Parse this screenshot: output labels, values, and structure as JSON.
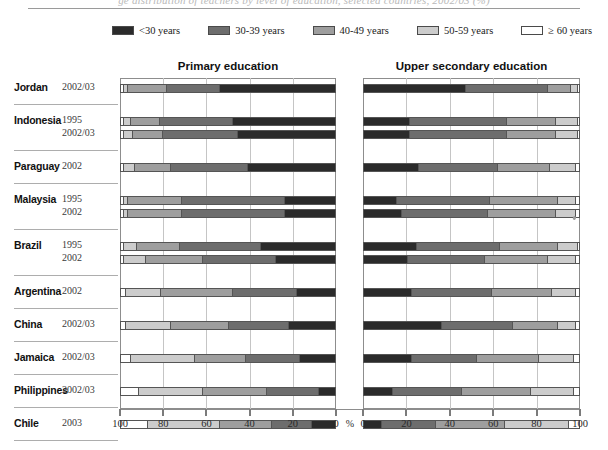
{
  "figure": {
    "cut_title": "ge distribution of teachers by level of education, selected countries, 2002/03 (%)",
    "percent_symbol": "%"
  },
  "legend": {
    "items": [
      {
        "label": "<30 years",
        "color": "#2b2b2b"
      },
      {
        "label": "30-39 years",
        "color": "#6d6d6d"
      },
      {
        "label": "40-49 years",
        "color": "#9e9e9e"
      },
      {
        "label": "50-59 years",
        "color": "#cccccc"
      },
      {
        "label": "≥ 60 years",
        "color": "#ffffff"
      }
    ]
  },
  "panels": [
    {
      "id": "primary",
      "title": "Primary education",
      "direction": "right-to-left",
      "axis_ticks": [
        100,
        80,
        60,
        40,
        20,
        0
      ]
    },
    {
      "id": "secondary",
      "title": "Upper secondary education",
      "direction": "left-to-right",
      "axis_ticks": [
        0,
        20,
        40,
        60,
        80,
        100
      ]
    }
  ],
  "rows": [
    {
      "country": "Jordan",
      "year": "2002/03",
      "group": 0
    },
    {
      "country": "Indonesia",
      "year": "1995",
      "group": 1
    },
    {
      "country": "",
      "year": "2002/03",
      "group": 1
    },
    {
      "country": "Paraguay",
      "year": "2002",
      "group": 2
    },
    {
      "country": "Malaysia",
      "year": "1995",
      "group": 3
    },
    {
      "country": "",
      "year": "2002",
      "group": 3
    },
    {
      "country": "Brazil",
      "year": "1995",
      "group": 4
    },
    {
      "country": "",
      "year": "2002",
      "group": 4
    },
    {
      "country": "Argentina",
      "year": "2002",
      "group": 5
    },
    {
      "country": "China",
      "year": "2002/03",
      "group": 6
    },
    {
      "country": "Jamaica",
      "year": "2002/03",
      "group": 7
    },
    {
      "country": "Philippines",
      "year": "2002/03",
      "group": 8
    },
    {
      "country": "Chile",
      "year": "2003",
      "group": 9
    }
  ],
  "chart_data": {
    "type": "bar",
    "subtype": "stacked-horizontal-diverging",
    "xlabel": "%",
    "ylabel": "",
    "xlim": [
      0,
      100
    ],
    "grid": true,
    "legend_position": "top",
    "series_names": [
      "<30 years",
      "30-39 years",
      "40-49 years",
      "50-59 years",
      "≥ 60 years"
    ],
    "categories": [
      "Jordan 2002/03",
      "Indonesia 1995",
      "Indonesia 2002/03",
      "Paraguay 2002",
      "Malaysia 1995",
      "Malaysia 2002",
      "Brazil 1995",
      "Brazil 2002",
      "Argentina 2002",
      "China 2002/03",
      "Jamaica 2002/03",
      "Philippines 2002/03",
      "Chile 2003"
    ],
    "panels": [
      {
        "name": "Primary education",
        "axis_ticks": [
          100,
          80,
          60,
          40,
          20,
          0
        ],
        "stacks": [
          {
            "category": "Jordan 2002/03",
            "values": {
              "<30 years": 54,
              "30-39 years": 25,
              "40-49 years": 18,
              "50-59 years": 2,
              "≥ 60 years": 1
            }
          },
          {
            "category": "Indonesia 1995",
            "values": {
              "<30 years": 48,
              "30-39 years": 34,
              "40-49 years": 14,
              "50-59 years": 3,
              "≥ 60 years": 1
            }
          },
          {
            "country_note": "",
            "category": "Indonesia 2002/03",
            "values": {
              "<30 years": 46,
              "30-39 years": 35,
              "40-49 years": 14,
              "50-59 years": 4,
              "≥ 60 years": 1
            }
          },
          {
            "category": "Paraguay 2002",
            "values": {
              "<30 years": 41,
              "30-39 years": 36,
              "40-49 years": 17,
              "50-59 years": 5,
              "≥ 60 years": 1
            }
          },
          {
            "category": "Malaysia 1995",
            "values": {
              "<30 years": 24,
              "30-39 years": 48,
              "40-49 years": 25,
              "50-59 years": 2,
              "≥ 60 years": 1
            }
          },
          {
            "category": "Malaysia 2002",
            "values": {
              "<30 years": 24,
              "30-39 years": 48,
              "40-49 years": 25,
              "50-59 years": 2,
              "≥ 60 years": 1
            }
          },
          {
            "category": "Brazil 1995",
            "values": {
              "<30 years": 35,
              "30-39 years": 38,
              "40-49 years": 20,
              "50-59 years": 6,
              "≥ 60 years": 1
            }
          },
          {
            "category": "Brazil 2002",
            "values": {
              "<30 years": 28,
              "30-39 years": 34,
              "40-49 years": 27,
              "50-59 years": 10,
              "≥ 60 years": 1
            }
          },
          {
            "category": "Argentina 2002",
            "values": {
              "<30 years": 18,
              "30-39 years": 30,
              "40-49 years": 34,
              "50-59 years": 16,
              "≥ 60 years": 2
            }
          },
          {
            "category": "China 2002/03",
            "values": {
              "<30 years": 22,
              "30-39 years": 28,
              "40-49 years": 27,
              "50-59 years": 21,
              "≥ 60 years": 2
            }
          },
          {
            "category": "Jamaica 2002/03",
            "values": {
              "<30 years": 17,
              "30-39 years": 25,
              "40-49 years": 24,
              "50-59 years": 30,
              "≥ 60 years": 4
            }
          },
          {
            "category": "Philippines 2002/03",
            "values": {
              "<30 years": 8,
              "30-39 years": 24,
              "40-49 years": 30,
              "50-59 years": 30,
              "≥ 60 years": 8
            }
          },
          {
            "category": "Chile 2003",
            "values": {
              "<30 years": 11,
              "30-39 years": 19,
              "40-49 years": 24,
              "50-59 years": 34,
              "≥ 60 years": 12
            }
          }
        ]
      },
      {
        "name": "Upper secondary education",
        "axis_ticks": [
          0,
          20,
          40,
          60,
          80,
          100
        ],
        "stacks": [
          {
            "category": "Jordan 2002/03",
            "values": {
              "<30 years": 47,
              "30-39 years": 38,
              "40-49 years": 11,
              "50-59 years": 3,
              "≥ 60 years": 1
            }
          },
          {
            "category": "Indonesia 1995",
            "values": {
              "<30 years": 21,
              "30-39 years": 45,
              "40-49 years": 23,
              "50-59 years": 10,
              "≥ 60 years": 1
            }
          },
          {
            "category": "Indonesia 2002/03",
            "values": {
              "<30 years": 21,
              "30-39 years": 45,
              "40-49 years": 23,
              "50-59 years": 10,
              "≥ 60 years": 1
            }
          },
          {
            "category": "Paraguay 2002",
            "values": {
              "<30 years": 25,
              "30-39 years": 37,
              "40-49 years": 24,
              "50-59 years": 12,
              "≥ 60 years": 2
            }
          },
          {
            "category": "Malaysia 1995",
            "values": {
              "<30 years": 15,
              "30-39 years": 43,
              "40-49 years": 32,
              "50-59 years": 8,
              "≥ 60 years": 2
            }
          },
          {
            "category": "Malaysia 2002",
            "values": {
              "<30 years": 17,
              "30-39 years": 40,
              "40-49 years": 32,
              "50-59 years": 9,
              "≥ 60 years": 2
            }
          },
          {
            "category": "Brazil 1995",
            "values": {
              "<30 years": 24,
              "30-39 years": 39,
              "40-49 years": 27,
              "50-59 years": 9,
              "≥ 60 years": 1
            }
          },
          {
            "category": "Brazil 2002",
            "values": {
              "<30 years": 20,
              "30-39 years": 36,
              "40-49 years": 29,
              "50-59 years": 13,
              "≥ 60 years": 2
            }
          },
          {
            "category": "Argentina 2002",
            "values": {
              "<30 years": 22,
              "30-39 years": 37,
              "40-49 years": 28,
              "50-59 years": 11,
              "≥ 60 years": 2
            }
          },
          {
            "category": "China 2002/03",
            "values": {
              "<30 years": 36,
              "30-39 years": 33,
              "40-49 years": 21,
              "50-59 years": 8,
              "≥ 60 years": 2
            }
          },
          {
            "category": "Jamaica 2002/03",
            "values": {
              "<30 years": 22,
              "30-39 years": 30,
              "40-49 years": 29,
              "50-59 years": 16,
              "≥ 60 years": 3
            }
          },
          {
            "category": "Philippines 2002/03",
            "values": {
              "<30 years": 13,
              "30-39 years": 32,
              "40-49 years": 32,
              "50-59 years": 20,
              "≥ 60 years": 3
            }
          },
          {
            "category": "Chile 2003",
            "values": {
              "<30 years": 8,
              "30-39 years": 25,
              "40-49 years": 32,
              "50-59 years": 30,
              "≥ 60 years": 5
            }
          }
        ]
      }
    ]
  }
}
